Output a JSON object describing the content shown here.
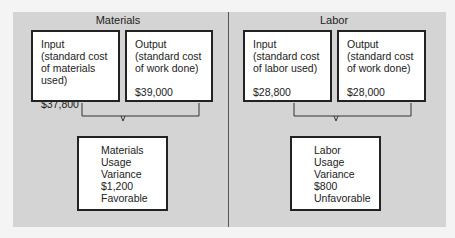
{
  "sections": [
    {
      "title": "Materials",
      "input": {
        "label": "Input",
        "desc1": "(standard cost",
        "desc2": "of materials used)",
        "amount": "$37,800"
      },
      "output": {
        "label": "Output",
        "desc1": "(standard cost",
        "desc2": "of work done)",
        "amount": "$39,000"
      },
      "result": {
        "line1": "Materials",
        "line2": "Usage",
        "line3": "Variance",
        "amount": "$1,200",
        "status": "Favorable"
      }
    },
    {
      "title": "Labor",
      "input": {
        "label": "Input",
        "desc1": "(standard cost",
        "desc2": "of labor used)",
        "amount": "$28,800"
      },
      "output": {
        "label": "Output",
        "desc1": "(standard cost",
        "desc2": "of work done)",
        "amount": "$28,000"
      },
      "result": {
        "line1": "Labor",
        "line2": "Usage",
        "line3": "Variance",
        "amount": "$800",
        "status": "Unfavorable"
      }
    }
  ]
}
